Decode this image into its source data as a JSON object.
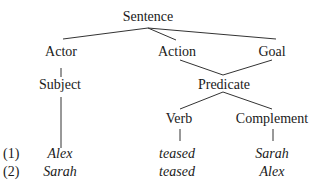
{
  "tree": {
    "root": "Sentence",
    "level1": {
      "actor": "Actor",
      "action": "Action",
      "goal": "Goal"
    },
    "level2": {
      "subject": "Subject",
      "predicate": "Predicate"
    },
    "level3": {
      "verb": "Verb",
      "complement": "Complement"
    }
  },
  "examples": [
    {
      "number": "(1)",
      "subject": "Alex",
      "verb": "teased",
      "complement": "Sarah"
    },
    {
      "number": "(2)",
      "subject": "Sarah",
      "verb": "teased",
      "complement": "Alex"
    }
  ]
}
